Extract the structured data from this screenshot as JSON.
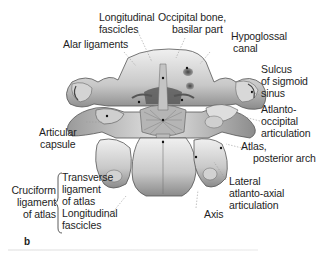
{
  "figure": {
    "panel_letter": "b"
  },
  "labels": {
    "longitudinal_fascicles_top": [
      "Longitudinal",
      "fascicles"
    ],
    "occipital_bone": [
      "Occipital bone,",
      "basilar part"
    ],
    "alar_ligaments": [
      "Alar ligaments"
    ],
    "hypoglossal_canal": [
      "Hypoglossal",
      "canal"
    ],
    "sulcus_sigmoid": [
      "Sulcus",
      "of sigmoid",
      "sinus"
    ],
    "articular_capsule": [
      "Articular",
      "capsule"
    ],
    "atlanto_occipital": [
      "Atlanto-",
      "occipital",
      "articulation"
    ],
    "atlas_posterior_arch": [
      "Atlas,",
      "posterior arch"
    ],
    "lateral_atlanto_axial": [
      "Lateral",
      "atlanto-axial",
      "articulation"
    ],
    "axis": [
      "Axis"
    ],
    "cruciform": [
      "Cruciform",
      "ligament",
      "of atlas"
    ],
    "transverse_ligament": [
      "Transverse",
      "ligament",
      "of atlas"
    ],
    "longitudinal_fascicles_bottom": [
      "Longitudinal",
      "fascicles"
    ]
  },
  "colors": {
    "bone_light": "#e6e6e6",
    "bone_mid": "#b9b9b9",
    "bone_dark": "#6e6e6e",
    "leader": "#9a9a9a",
    "text": "#1e1e1e"
  }
}
